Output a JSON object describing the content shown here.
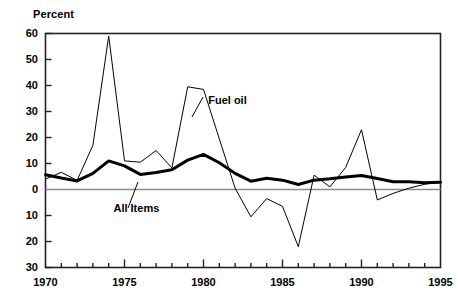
{
  "chart_data": {
    "type": "line",
    "title": "",
    "ylabel": "Percent",
    "xlabel": "",
    "xlim": [
      1970,
      1995
    ],
    "ylim": [
      -30,
      60
    ],
    "grid": false,
    "legend": "inline-annotations",
    "zero_line": 0,
    "y_ticks_major": [
      60,
      50,
      40,
      30,
      20,
      10,
      0,
      10,
      20,
      30
    ],
    "y_ticks_major_values": [
      60,
      50,
      40,
      30,
      20,
      10,
      0,
      -10,
      -20,
      -30
    ],
    "x_ticks_major": [
      1970,
      1975,
      1980,
      1985,
      1990,
      1995
    ],
    "x_minor_tick_step": 1,
    "y_minor_tick_step": 10,
    "x": [
      1970,
      1971,
      1972,
      1973,
      1974,
      1975,
      1976,
      1977,
      1978,
      1979,
      1980,
      1981,
      1982,
      1983,
      1984,
      1985,
      1986,
      1987,
      1988,
      1989,
      1990,
      1991,
      1992,
      1993,
      1994,
      1995
    ],
    "series": [
      {
        "name": "Fuel oil",
        "style": "thin",
        "color": "#000000",
        "width": 1,
        "values": [
          4.0,
          6.6,
          3.5,
          17.0,
          59.0,
          11.0,
          10.5,
          15.0,
          8.3,
          39.5,
          38.5,
          19.5,
          0.5,
          -10.5,
          -3.5,
          -6.5,
          -22.0,
          5.5,
          1.0,
          8.5,
          23.0,
          -4.0,
          -1.5,
          0.5,
          2.0,
          3.0
        ]
      },
      {
        "name": "All Items",
        "style": "thick",
        "color": "#000000",
        "width": 3,
        "values": [
          5.7,
          4.4,
          3.3,
          6.2,
          11.0,
          9.1,
          5.8,
          6.5,
          7.6,
          11.3,
          13.5,
          10.3,
          6.2,
          3.2,
          4.3,
          3.6,
          1.9,
          3.6,
          4.1,
          4.8,
          5.4,
          4.2,
          3.0,
          3.0,
          2.6,
          2.8
        ]
      }
    ],
    "annotations": [
      {
        "text": "Fuel oil",
        "x": 1980.3,
        "y": 34.0
      },
      {
        "text": "All Items",
        "x": 1974.3,
        "y": -7.5
      }
    ]
  },
  "axis": {
    "y_title": "Percent",
    "y_tick_labels": [
      "60",
      "50",
      "40",
      "30",
      "20",
      "10",
      "0",
      "10",
      "20",
      "30"
    ],
    "x_tick_labels": [
      "1970",
      "1975",
      "1980",
      "1985",
      "1990",
      "1995"
    ]
  },
  "colors": {
    "frame": "#222222",
    "zero_line": "#8c8c8c",
    "line": "#000000",
    "background": "#ffffff"
  }
}
